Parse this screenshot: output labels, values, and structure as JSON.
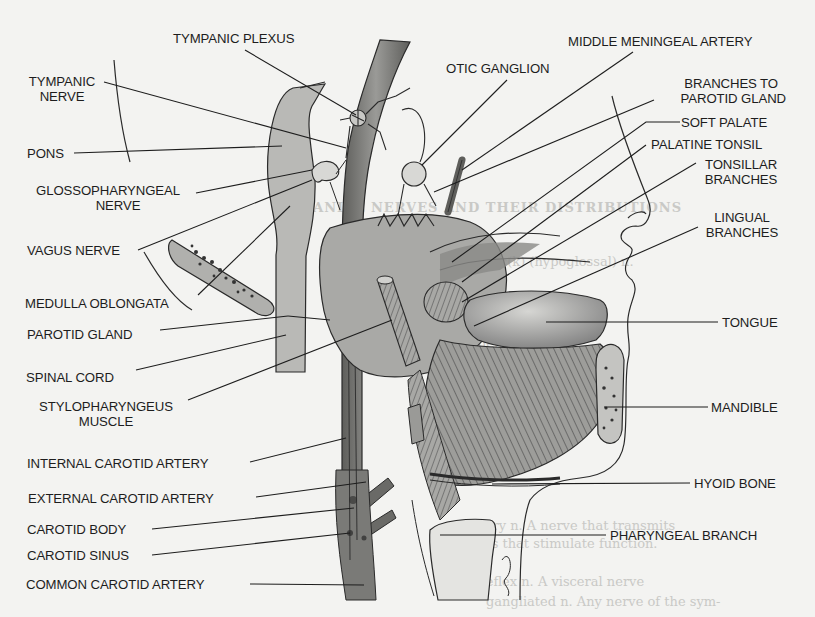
{
  "figure": {
    "palette": {
      "background": "#f3f3f1",
      "ink": "#1d1d1d",
      "structure_fill": "#b9b9b6",
      "vessel_fill": "#7c7c79",
      "bleed_text": "#c9c9c6"
    },
    "labels_left": {
      "tympanic_plexus": "TYMPANIC PLEXUS",
      "tympanic_nerve_1": "TYMPANIC",
      "tympanic_nerve_2": "NERVE",
      "pons": "PONS",
      "glossopharyngeal_1": "GLOSSOPHARYNGEAL",
      "glossopharyngeal_2": "NERVE",
      "vagus_nerve": "VAGUS NERVE",
      "medulla_oblongata": "MEDULLA OBLONGATA",
      "parotid_gland": "PAROTID GLAND",
      "spinal_cord": "SPINAL CORD",
      "stylopharyngeus_1": "STYLOPHARYNGEUS",
      "stylopharyngeus_2": "MUSCLE",
      "internal_carotid_artery": "INTERNAL CAROTID ARTERY",
      "external_carotid_artery": "EXTERNAL CAROTID ARTERY",
      "carotid_body": "CAROTID BODY",
      "carotid_sinus": "CAROTID SINUS",
      "common_carotid_artery": "COMMON CAROTID ARTERY"
    },
    "labels_right": {
      "middle_meningeal_artery": "MIDDLE MENINGEAL ARTERY",
      "otic_ganglion": "OTIC GANGLION",
      "branches_to_parotid_1": "BRANCHES TO",
      "branches_to_parotid_2": "PAROTID GLAND",
      "soft_palate": "SOFT PALATE",
      "palatine_tonsil": "PALATINE TONSIL",
      "tonsillar_branches_1": "TONSILLAR",
      "tonsillar_branches_2": "BRANCHES",
      "lingual_branches_1": "LINGUAL",
      "lingual_branches_2": "BRANCHES",
      "tongue": "TONGUE",
      "mandible": "MANDIBLE",
      "hyoid_bone": "HYOID BONE",
      "pharyngeal_branch": "PHARYNGEAL BRANCH"
    },
    "bleed_through": {
      "line_1": "CRANIAL NERVES AND THEIR DISTRIBUTIONS",
      "line_2": "side. Tic(k) (hypoglossal) n.",
      "line_3": "depressor n.",
      "line_4": "excitatory n.  A nerve that transmits",
      "line_5": "impulses that stimulate function.",
      "line_6": "excitoreflex n.  A visceral nerve",
      "line_7": "gangliated n.  Any nerve of the sym-"
    }
  }
}
